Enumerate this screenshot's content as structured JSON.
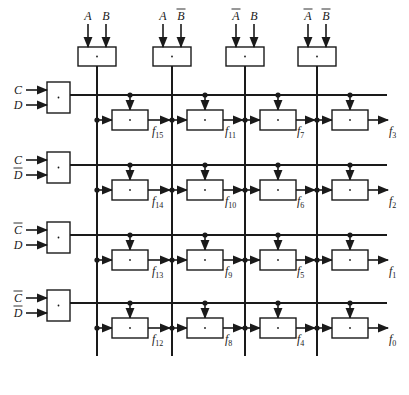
{
  "diagram": {
    "colors": {
      "line": "#1a1a1a",
      "box_fill": "#ffffff",
      "background": "#ffffff"
    },
    "gate_symbol": "·",
    "top_gates": [
      {
        "id": "top-gate-ab",
        "inputs": [
          "A",
          "B"
        ],
        "bars": [
          false,
          false
        ]
      },
      {
        "id": "top-gate-a-bbar",
        "inputs": [
          "A",
          "B"
        ],
        "bars": [
          false,
          true
        ]
      },
      {
        "id": "top-gate-abar-b",
        "inputs": [
          "A",
          "B"
        ],
        "bars": [
          true,
          false
        ]
      },
      {
        "id": "top-gate-abar-bbar",
        "inputs": [
          "A",
          "B"
        ],
        "bars": [
          true,
          true
        ]
      }
    ],
    "left_gates": [
      {
        "id": "left-gate-cd",
        "inputs": [
          "C",
          "D"
        ],
        "bars": [
          false,
          false
        ]
      },
      {
        "id": "left-gate-c-dbar",
        "inputs": [
          "C",
          "D"
        ],
        "bars": [
          false,
          true
        ]
      },
      {
        "id": "left-gate-cbar-d",
        "inputs": [
          "C",
          "D"
        ],
        "bars": [
          true,
          false
        ]
      },
      {
        "id": "left-gate-cbar-dbar",
        "inputs": [
          "C",
          "D"
        ],
        "bars": [
          true,
          true
        ]
      }
    ],
    "outputs": [
      [
        "15",
        "11",
        "7",
        "3"
      ],
      [
        "14",
        "10",
        "6",
        "2"
      ],
      [
        "13",
        "9",
        "5",
        "1"
      ],
      [
        "12",
        "8",
        "4",
        "0"
      ]
    ],
    "output_prefix": "f"
  }
}
